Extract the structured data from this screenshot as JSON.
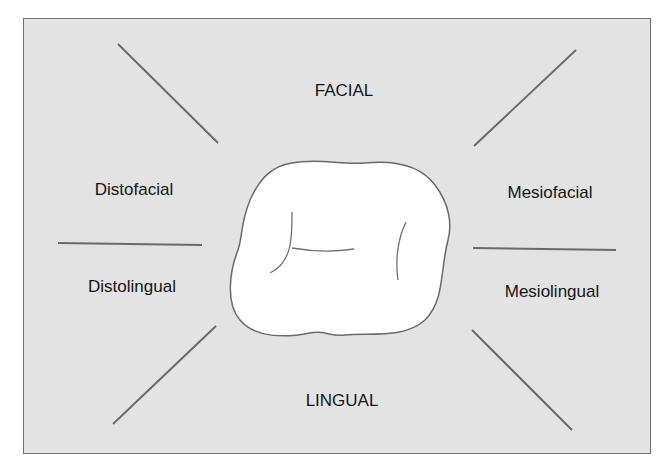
{
  "diagram": {
    "colors": {
      "background": "#e3e3e3",
      "border": "#6f6f6f",
      "line": "#6a6a6a",
      "tooth_fill": "#ffffff",
      "text": "#151515"
    },
    "labels": {
      "facial": "FACIAL",
      "lingual": "LINGUAL",
      "distofacial": "Distofacial",
      "mesiofacial": "Mesiofacial",
      "distolingual": "Distolingual",
      "mesiolingual": "Mesiolingual"
    },
    "center_shape": "occlusal-outline-of-tooth"
  }
}
